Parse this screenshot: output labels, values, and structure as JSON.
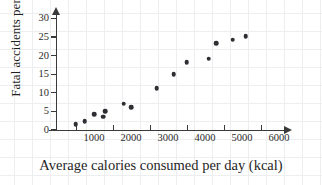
{
  "chart_data": {
    "type": "scatter",
    "title": "",
    "xlabel": "Average calories consumed per day (kcal)",
    "ylabel": "Fatal accidents per day",
    "xlim": [
      0,
      6300
    ],
    "ylim": [
      0,
      31
    ],
    "xticks": [
      1000,
      2000,
      3000,
      4000,
      5000,
      6000
    ],
    "xtick_labels": [
      "1000",
      "2000",
      "3000",
      "4000",
      "5000",
      "6000"
    ],
    "yticks": [
      0,
      5,
      10,
      15,
      20,
      25,
      30
    ],
    "ytick_labels": [
      "0",
      "5",
      "10",
      "15",
      "20",
      "25",
      "30"
    ],
    "grid": "background notebook grid, light gray",
    "legend": "none",
    "marker_color": "#2f2f33",
    "axis_color": "#3a3a3a",
    "grid_color": "#eceef0",
    "points": [
      {
        "x": 500,
        "y": 1.5
      },
      {
        "x": 750,
        "y": 2.4
      },
      {
        "x": 1000,
        "y": 4.3
      },
      {
        "x": 1250,
        "y": 3.6
      },
      {
        "x": 1300,
        "y": 5.0
      },
      {
        "x": 1800,
        "y": 7.1
      },
      {
        "x": 2000,
        "y": 6.2
      },
      {
        "x": 2700,
        "y": 11.2
      },
      {
        "x": 3150,
        "y": 15.0
      },
      {
        "x": 3500,
        "y": 18.2
      },
      {
        "x": 4100,
        "y": 19.2
      },
      {
        "x": 4300,
        "y": 23.3
      },
      {
        "x": 4750,
        "y": 24.3
      },
      {
        "x": 5100,
        "y": 25.2
      }
    ]
  }
}
